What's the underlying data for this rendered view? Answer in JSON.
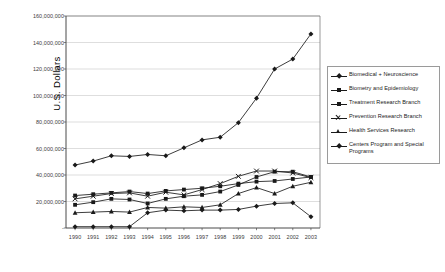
{
  "chart_data": {
    "type": "line",
    "title": "",
    "xlabel": "",
    "ylabel": "U.S. Dollars",
    "grid": true,
    "legend_position": "right",
    "ylim": [
      0,
      160000000
    ],
    "ytick_step": 20000000,
    "ytick_labels": [
      "160,000,000",
      "140,000,000",
      "120,000,000",
      "100,000,000",
      "80,000,000",
      "60,000,000",
      "40,000,000",
      "20,000,000",
      "-"
    ],
    "ytick_values": [
      160000000,
      140000000,
      120000000,
      100000000,
      80000000,
      60000000,
      40000000,
      20000000,
      0
    ],
    "categories": [
      "1990",
      "1991",
      "1992",
      "1993",
      "1994",
      "1995",
      "1996",
      "1997",
      "1998",
      "1999",
      "2000",
      "2001",
      "2002",
      "2003"
    ],
    "series": [
      {
        "name": "Biomedical + Neuroscience",
        "marker": "diamond",
        "color": "#1a1a1a",
        "values": [
          47500000,
          50500000,
          54500000,
          54000000,
          55500000,
          54500000,
          60500000,
          66500000,
          68500000,
          79500000,
          98000000,
          120000000,
          127500000,
          146500000
        ]
      },
      {
        "name": "Biometry and Epidemiology",
        "marker": "square",
        "color": "#1a1a1a",
        "values": [
          24500000,
          25500000,
          26500000,
          27500000,
          26000000,
          28000000,
          29000000,
          30000000,
          31500000,
          33500000,
          35000000,
          35500000,
          37000000,
          38500000
        ]
      },
      {
        "name": "Treatment Research Branch",
        "marker": "square",
        "color": "#1a1a1a",
        "values": [
          17500000,
          19500000,
          22000000,
          21500000,
          18500000,
          22000000,
          24000000,
          25000000,
          27500000,
          32500000,
          38500000,
          42500000,
          42500000,
          38500000
        ]
      },
      {
        "name": "Prevention Research Branch",
        "marker": "x",
        "color": "#1a1a1a",
        "values": [
          22000000,
          24000000,
          26000000,
          26500000,
          24000000,
          27000000,
          25000000,
          29000000,
          33500000,
          39000000,
          43000000,
          43000000,
          41500000,
          38000000
        ]
      },
      {
        "name": "Health Services Research",
        "marker": "triangle",
        "color": "#1a1a1a",
        "values": [
          11500000,
          12000000,
          12500000,
          12000000,
          15500000,
          15000000,
          16000000,
          15500000,
          17500000,
          26000000,
          30500000,
          26000000,
          31500000,
          34500000
        ]
      },
      {
        "name": "Centers Program and Special Programs",
        "marker": "diamond",
        "color": "#1a1a1a",
        "values": [
          1000000,
          1000000,
          1000000,
          1000000,
          11500000,
          13500000,
          13000000,
          13500000,
          13500000,
          14000000,
          16500000,
          18500000,
          19000000,
          8500000
        ]
      }
    ]
  },
  "axis": {
    "y_title": "U.S. Dollars"
  }
}
